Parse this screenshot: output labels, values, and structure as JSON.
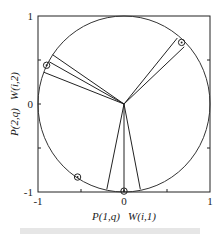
{
  "chart_data": {
    "type": "scatter",
    "title": "",
    "xlabel": "P(1,q)   W(i,1)",
    "ylabel": "P(2,q)   W(i,2)",
    "xlim": [
      -1,
      1
    ],
    "ylim": [
      -1,
      1
    ],
    "grid": false,
    "x_ticks": [
      "-1",
      "0",
      "1"
    ],
    "y_ticks": [
      "-1",
      "0",
      "1"
    ],
    "unit_circle": true,
    "prototype_points_circled": [
      {
        "x": 0.67,
        "y": 0.7
      },
      {
        "x": -0.9,
        "y": 0.44
      },
      {
        "x": -0.54,
        "y": -0.83
      },
      {
        "x": 0.0,
        "y": -0.99
      }
    ],
    "weight_vectors": [
      {
        "x": 0.62,
        "y": 0.75
      },
      {
        "x": 0.7,
        "y": 0.65
      },
      {
        "x": -0.83,
        "y": 0.56
      },
      {
        "x": -0.87,
        "y": 0.48
      },
      {
        "x": -0.93,
        "y": 0.36
      },
      {
        "x": -0.2,
        "y": -0.97
      },
      {
        "x": 0.0,
        "y": -1.0
      },
      {
        "x": 0.19,
        "y": -0.97
      }
    ]
  },
  "labels": {
    "x_tick_neg1": "-1",
    "x_tick_0": "0",
    "x_tick_1": "1",
    "y_tick_neg1": "-1",
    "y_tick_0": "0",
    "y_tick_1": "1",
    "xlabel": "P(1,q)   W(i,1)",
    "ylabel": "P(2,q)   W(i,2)"
  }
}
